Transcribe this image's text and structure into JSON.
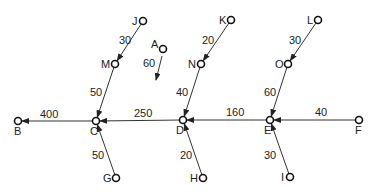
{
  "diagram": {
    "title": "",
    "nodes": [
      {
        "id": "J",
        "label": "J",
        "x": 143,
        "y": 21,
        "lx": -11,
        "ly": 4
      },
      {
        "id": "A",
        "label": "A",
        "x": 163,
        "y": 49,
        "lx": -12,
        "ly": -1
      },
      {
        "id": "M",
        "label": "M",
        "x": 115,
        "y": 64,
        "lx": -14,
        "ly": 4
      },
      {
        "id": "K",
        "label": "K",
        "x": 231,
        "y": 20,
        "lx": -12,
        "ly": 4
      },
      {
        "id": "N",
        "label": "N",
        "x": 201,
        "y": 64,
        "lx": -13,
        "ly": 4
      },
      {
        "id": "L",
        "label": "L",
        "x": 318,
        "y": 20,
        "lx": -11,
        "ly": 4
      },
      {
        "id": "O",
        "label": "O",
        "x": 288,
        "y": 64,
        "lx": -13,
        "ly": 4
      },
      {
        "id": "B",
        "label": "B",
        "x": 18,
        "y": 121,
        "lx": -4,
        "ly": 14
      },
      {
        "id": "C",
        "label": "C",
        "x": 96,
        "y": 121,
        "lx": -6,
        "ly": 14
      },
      {
        "id": "D",
        "label": "D",
        "x": 183,
        "y": 120,
        "lx": -7,
        "ly": 14
      },
      {
        "id": "E",
        "label": "E",
        "x": 270,
        "y": 120,
        "lx": -6,
        "ly": 14
      },
      {
        "id": "F",
        "label": "F",
        "x": 359,
        "y": 120,
        "lx": -4,
        "ly": 14
      },
      {
        "id": "G",
        "label": "G",
        "x": 116,
        "y": 178,
        "lx": -13,
        "ly": 4
      },
      {
        "id": "H",
        "label": "H",
        "x": 203,
        "y": 178,
        "lx": -13,
        "ly": 4
      },
      {
        "id": "I",
        "label": "I",
        "x": 290,
        "y": 177,
        "lx": -9,
        "ly": 4
      }
    ],
    "edges": [
      {
        "from": "J",
        "to": "M",
        "weight": "30",
        "wx": 119,
        "wy": 44
      },
      {
        "from": "M",
        "to": "C",
        "weight": "50",
        "wx": 90,
        "wy": 96
      },
      {
        "from": "K",
        "to": "N",
        "weight": "20",
        "wx": 202,
        "wy": 44
      },
      {
        "from": "N",
        "to": "D",
        "weight": "40",
        "wx": 176,
        "wy": 96
      },
      {
        "from": "L",
        "to": "O",
        "weight": "30",
        "wx": 289,
        "wy": 44
      },
      {
        "from": "O",
        "to": "E",
        "weight": "60",
        "wx": 264,
        "wy": 96
      },
      {
        "from": "C",
        "to": "B",
        "weight": "400",
        "wx": 40,
        "wy": 118
      },
      {
        "from": "D",
        "to": "C",
        "weight": "250",
        "wx": 134,
        "wy": 117
      },
      {
        "from": "E",
        "to": "D",
        "weight": "160",
        "wx": 226,
        "wy": 116
      },
      {
        "from": "F",
        "to": "E",
        "weight": "40",
        "wx": 315,
        "wy": 116
      },
      {
        "from": "G",
        "to": "C",
        "weight": "50",
        "wx": 92,
        "wy": 159
      },
      {
        "from": "H",
        "to": "D",
        "weight": "20",
        "wx": 180,
        "wy": 159
      },
      {
        "from": "I",
        "to": "E",
        "weight": "30",
        "wx": 264,
        "wy": 159
      }
    ],
    "dangling_arrows": [
      {
        "from": "A",
        "weight": "60",
        "x1": 162,
        "y1": 56,
        "x2": 156,
        "y2": 80,
        "wx": 143,
        "wy": 67
      }
    ],
    "colors": {
      "line": "#333333",
      "node_stroke": "#111111",
      "text": "#222222",
      "background": "#ffffff"
    }
  }
}
